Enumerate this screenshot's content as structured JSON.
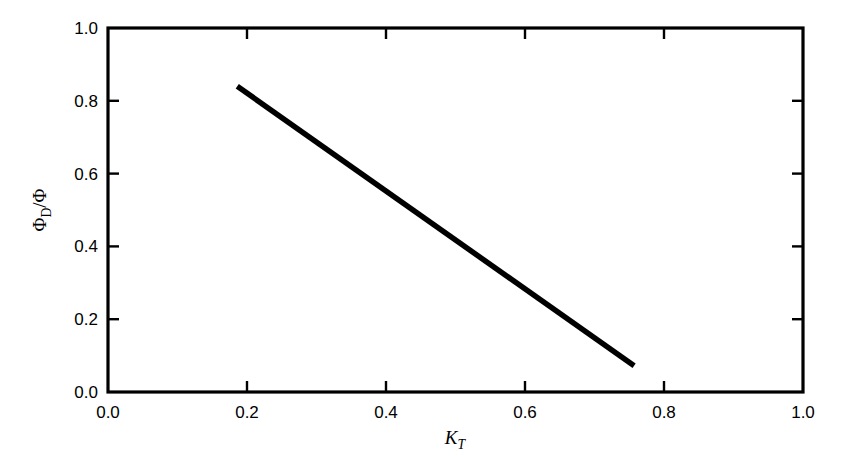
{
  "chart_data": {
    "type": "line",
    "title": "",
    "subtitle": "",
    "xlabel": "K_T",
    "xlabel_base": "K",
    "xlabel_sub": "T",
    "ylabel": "Φ_D/Φ",
    "ylabel_base": "Φ",
    "ylabel_sub": "D",
    "ylabel_tail": "/Φ",
    "xlim": [
      0.0,
      1.0
    ],
    "ylim": [
      0.0,
      1.0
    ],
    "xticks": [
      "0.0",
      "0.2",
      "0.4",
      "0.6",
      "0.8",
      "1.0"
    ],
    "xtick_values": [
      0.0,
      0.2,
      0.4,
      0.6,
      0.8,
      1.0
    ],
    "yticks": [
      "0.0",
      "0.2",
      "0.4",
      "0.6",
      "0.8",
      "1.0"
    ],
    "ytick_values": [
      0.0,
      0.2,
      0.4,
      0.6,
      0.8,
      1.0
    ],
    "grid": false,
    "legend": false,
    "legend_position": "none",
    "tick_direction": "in",
    "frame": "full-box",
    "series": [
      {
        "name": "diffuse fraction",
        "x": [
          0.186,
          0.757
        ],
        "values": [
          0.84,
          0.072
        ],
        "color": "#000000",
        "linewidth": 5.5,
        "style": "solid"
      }
    ]
  },
  "figure": {
    "background": "#ffffff",
    "axis_color": "#000000",
    "text_color": "#000000"
  }
}
